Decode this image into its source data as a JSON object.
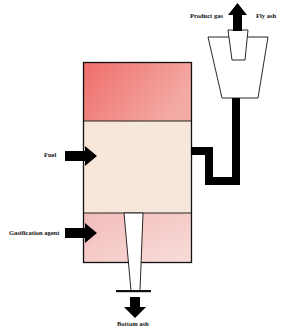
{
  "diagram": {
    "title": "",
    "labels": {
      "product_gas": "Product gas",
      "fly_ash": "Fly ash",
      "fuel": "Fuel",
      "gasification_agent": "Gasification agent",
      "bottom_ash": "Bottom ash"
    },
    "colors": {
      "top_zone": "#f08a84",
      "middle_zone": "#f7e6da",
      "bottom_zone": "#f4c4c2",
      "outline": "#111111",
      "arrow": "#000000"
    },
    "components": [
      {
        "id": "reactor-vessel",
        "zones": [
          "top",
          "middle",
          "bottom"
        ]
      },
      {
        "id": "cyclone"
      },
      {
        "id": "ash-discharge-tube"
      },
      {
        "id": "gas-duct"
      }
    ]
  }
}
